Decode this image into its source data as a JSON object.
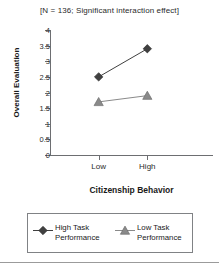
{
  "chart_data": {
    "type": "line",
    "title": "[N = 136; Significant interaction effect]",
    "xlabel": "Citizenship Behavior",
    "ylabel": "Overall Evaluation",
    "categories": [
      "Low",
      "High"
    ],
    "ylim": [
      0,
      4
    ],
    "ytick_labels": [
      "0",
      "0.5",
      "1",
      "1.5",
      "2",
      "2.5",
      "3",
      "3.5",
      "4"
    ],
    "ytick_values": [
      0,
      0.5,
      1,
      1.5,
      2,
      2.5,
      3,
      3.5,
      4
    ],
    "grid": false,
    "legend_position": "bottom",
    "series": [
      {
        "name": "High Task Performance",
        "marker": "diamond",
        "color": "#404040",
        "values": [
          2.5,
          3.4
        ]
      },
      {
        "name": "Low Task Performance",
        "marker": "triangle",
        "color": "#8a8a8a",
        "values": [
          1.7,
          1.9
        ]
      }
    ]
  },
  "legend": {
    "entries": [
      {
        "label_line1": "High Task",
        "label_line2": "Performance"
      },
      {
        "label_line1": "Low Task",
        "label_line2": "Performance"
      }
    ]
  },
  "colors": {
    "axis": "#6d6e71",
    "series_high": "#404040",
    "series_low": "#8a8a8a",
    "text": "#231f20"
  }
}
